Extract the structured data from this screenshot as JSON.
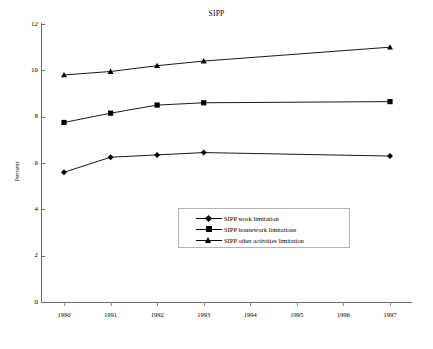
{
  "chart_data": {
    "type": "line",
    "title": "SIPP",
    "xlabel": "",
    "ylabel": "Percent",
    "x": [
      1990,
      1991,
      1992,
      1993,
      1994,
      1995,
      1996,
      1997
    ],
    "xticklabels": [
      "1990",
      "1991",
      "1992",
      "1993",
      "1994",
      "1995",
      "1996",
      "1997"
    ],
    "xlim": [
      1990,
      1997
    ],
    "ylim": [
      0,
      12
    ],
    "yticks": [
      0,
      2,
      4,
      6,
      8,
      10,
      12
    ],
    "yticklabels": [
      "0",
      "2",
      "4",
      "6",
      "8",
      "10",
      "12"
    ],
    "grid": false,
    "legend_position": "center",
    "series": [
      {
        "name": "SIPP other activities limitation",
        "marker": "triangle",
        "points": [
          {
            "x": 1990,
            "y": 9.8
          },
          {
            "x": 1991,
            "y": 9.95
          },
          {
            "x": 1992,
            "y": 10.2
          },
          {
            "x": 1993,
            "y": 10.4
          },
          {
            "x": 1997,
            "y": 11.0
          }
        ]
      },
      {
        "name": "SIPP housework limitations",
        "marker": "square",
        "points": [
          {
            "x": 1990,
            "y": 7.75
          },
          {
            "x": 1991,
            "y": 8.15
          },
          {
            "x": 1992,
            "y": 8.5
          },
          {
            "x": 1993,
            "y": 8.6
          },
          {
            "x": 1997,
            "y": 8.65
          }
        ]
      },
      {
        "name": "SIPP work limitation",
        "marker": "diamond",
        "points": [
          {
            "x": 1990,
            "y": 5.6
          },
          {
            "x": 1991,
            "y": 6.25
          },
          {
            "x": 1992,
            "y": 6.35
          },
          {
            "x": 1993,
            "y": 6.45
          },
          {
            "x": 1997,
            "y": 6.3
          }
        ]
      }
    ],
    "legend": [
      {
        "label": "SIPP work limitation",
        "marker": "diamond"
      },
      {
        "label": "SIPP housework limitations",
        "marker": "square"
      },
      {
        "label": "SIPP other activities limitation",
        "marker": "triangle"
      }
    ],
    "colors": {
      "line": "#000000",
      "marker": "#000000",
      "axis": "#6d6d6d",
      "background": "#ffffff",
      "legend_border": "#b4b4b4"
    }
  }
}
